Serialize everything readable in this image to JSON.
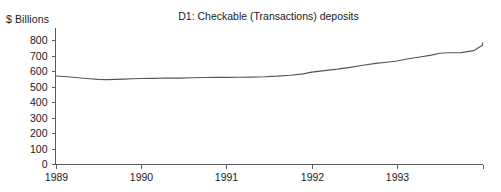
{
  "chart_data": {
    "type": "line",
    "title": "D1: Checkable (Transactions) deposits",
    "ylabel": "$ Billions",
    "xlabel": "",
    "ylim": [
      0,
      800
    ],
    "xlim": [
      1989,
      1994
    ],
    "grid": false,
    "legend": "none",
    "line_color": "#555555",
    "axis_color": "#5c5c5c",
    "y_ticks": [
      800,
      700,
      600,
      500,
      400,
      300,
      200,
      100,
      0
    ],
    "y_tick_labels": [
      "800",
      "700",
      "600",
      "500",
      "400",
      "300",
      "200",
      "100",
      "0"
    ],
    "x_ticks": [
      1989,
      1990,
      1991,
      1992,
      1993,
      1994
    ],
    "x_tick_labels": [
      "1989",
      "1990",
      "1991",
      "1992",
      "1993",
      ""
    ],
    "series": [
      {
        "name": "D1: Checkable (Transactions) deposits",
        "x": [
          1989.0,
          1989.1,
          1989.2,
          1989.3,
          1989.4,
          1989.5,
          1989.6,
          1989.7,
          1989.8,
          1989.9,
          1990.0,
          1990.15,
          1990.3,
          1990.45,
          1990.6,
          1990.75,
          1990.9,
          1991.0,
          1991.15,
          1991.3,
          1991.45,
          1991.6,
          1991.75,
          1991.9,
          1992.0,
          1992.15,
          1992.3,
          1992.45,
          1992.6,
          1992.75,
          1992.9,
          1993.0,
          1993.1,
          1993.25,
          1993.4,
          1993.5,
          1993.6,
          1993.75,
          1993.9,
          1994.0
        ],
        "values": [
          571,
          568,
          563,
          558,
          553,
          549,
          548,
          549,
          551,
          553,
          555,
          556,
          558,
          557,
          560,
          561,
          562,
          562,
          563,
          564,
          566,
          570,
          576,
          585,
          596,
          606,
          615,
          627,
          640,
          652,
          661,
          668,
          679,
          692,
          706,
          718,
          721,
          722,
          735,
          770
        ]
      }
    ],
    "end_value": 785,
    "min_value": 548,
    "max_value": 785
  }
}
